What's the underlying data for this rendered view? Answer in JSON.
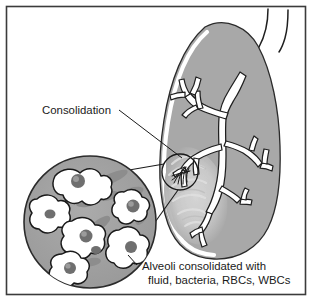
{
  "figure": {
    "type": "medical-illustration",
    "border_color": "#3b3b3b",
    "background_color": "#ffffff"
  },
  "labels": {
    "consolidation": "Consolidation",
    "caption_line1": "Alveoli consolidated with",
    "caption_line2": "fluid, bacteria, RBCs, WBCs"
  },
  "anatomy": {
    "lung": {
      "name": "lung",
      "fill_color": "#a8a8a8",
      "outline_color": "#2b2b2b",
      "inner_highlight_color": "#ffffff"
    },
    "bronchial_tree": {
      "name": "bronchial-tree",
      "fill_color": "#ffffff",
      "outline_color": "#1f1f1f"
    },
    "trachea": {
      "name": "trachea",
      "outline_color": "#1f1f1f"
    },
    "consolidation_patch": {
      "name": "consolidation-patch",
      "fill_color": "#c9c9c9"
    },
    "magnifier_circle": {
      "name": "alveoli-magnifier",
      "fill_color": "#a0a0a0",
      "outline_color": "#2b2b2b",
      "alveoli_fill": "#ffffff",
      "alveoli_outline": "#1a1a1a",
      "exudate_fill": "#8d8d8d",
      "cell_fill": "#6f6f6f"
    },
    "callout_circle": {
      "name": "consolidation-site-marker",
      "outline_color": "#1a1a1a"
    }
  },
  "leader_lines": {
    "consolidation_leader_color": "#1a1a1a",
    "magnifier_connector_color": "#1a1a1a",
    "caption_leader_color": "#1a1a1a"
  }
}
